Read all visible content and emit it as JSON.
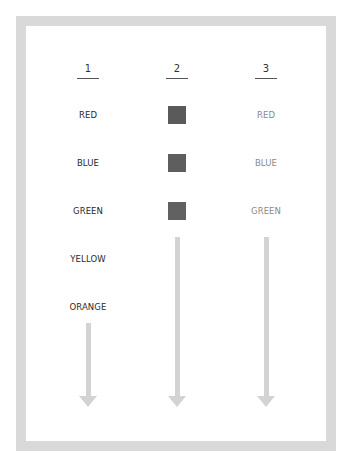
{
  "diagram": {
    "columns": [
      {
        "heading": "1",
        "items": [
          "RED",
          "BLUE",
          "GREEN",
          "YELLOW",
          "ORANGE"
        ],
        "style": "dark-text"
      },
      {
        "heading": "2",
        "items": [
          "color-swatch",
          "color-swatch",
          "color-swatch"
        ],
        "style": "swatches"
      },
      {
        "heading": "3",
        "items": [
          "RED",
          "BLUE",
          "GREEN"
        ],
        "style": "light-text"
      }
    ],
    "col1": {
      "heading": "1",
      "items": {
        "0": "RED",
        "1": "BLUE",
        "2": "GREEN",
        "3": "YELLOW",
        "4": "ORANGE"
      }
    },
    "col2": {
      "heading": "2",
      "swatch_colors": [
        "#5a5a5a",
        "#5e5e5e",
        "#616161"
      ]
    },
    "col3": {
      "heading": "3",
      "items": {
        "0": "RED",
        "1": "BLUE",
        "2": "GREEN"
      }
    },
    "colors": {
      "frame_border": "#d9d9d9",
      "arrow": "#d3d3d3",
      "dark_text": "#2a2a2a",
      "light_text": "#8a8a8a"
    },
    "arrows": [
      {
        "column": "1",
        "direction": "down"
      },
      {
        "column": "2",
        "direction": "down"
      },
      {
        "column": "3",
        "direction": "down"
      }
    ]
  }
}
